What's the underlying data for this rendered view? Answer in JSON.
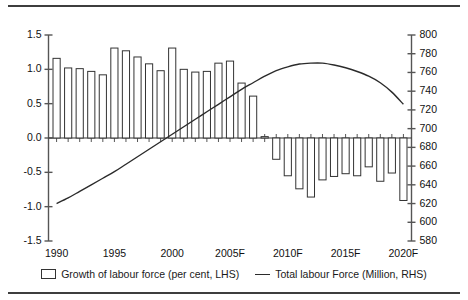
{
  "figure": {
    "has_top_rule": true,
    "has_bottom_rule": true,
    "background": "#ffffff",
    "line_color": "#2b2b2b",
    "bar_edge_color": "#333333",
    "bar_fill_color": "#ffffff",
    "axis_color": "#555555"
  },
  "legend": {
    "position": "bottom-center",
    "entries": [
      {
        "icon": "bar-swatch-icon",
        "label": "Growth of labour force (per cent, LHS)"
      },
      {
        "icon": "line-swatch-icon",
        "label": "Total labour Force (Million, RHS)"
      }
    ]
  },
  "axes": {
    "left": {
      "ticks": [
        "1.5",
        "1.0",
        "0.5",
        "0.0",
        "-0.5",
        "-1.0",
        "-1.5"
      ],
      "values": [
        1.5,
        1.0,
        0.5,
        0.0,
        -0.5,
        -1.0,
        -1.5
      ],
      "min": -1.5,
      "max": 1.5
    },
    "right": {
      "ticks": [
        "800",
        "780",
        "760",
        "740",
        "720",
        "700",
        "680",
        "660",
        "640",
        "620",
        "600",
        "580"
      ],
      "values": [
        800,
        780,
        760,
        740,
        720,
        700,
        680,
        660,
        640,
        620,
        600,
        580
      ],
      "min": 580,
      "max": 800
    },
    "bottom": {
      "ticks": [
        "1990",
        "1995",
        "2000",
        "2005F",
        "2010F",
        "2015F",
        "2020F"
      ],
      "tick_years": [
        1990,
        1995,
        2000,
        2005,
        2010,
        2015,
        2020
      ]
    }
  },
  "chart_data": {
    "type": "bar",
    "title": "",
    "subtitle": "",
    "xlabel": "",
    "ylabel": "",
    "y2label": "",
    "grid": false,
    "legend_position": "bottom",
    "categories": [
      "1990",
      "1991",
      "1992",
      "1993",
      "1994",
      "1995",
      "1996",
      "1997",
      "1998",
      "1999",
      "2000",
      "2001",
      "2002",
      "2003",
      "2004",
      "2005F",
      "2006F",
      "2007F",
      "2008F",
      "2009F",
      "2010F",
      "2011F",
      "2012F",
      "2013F",
      "2014F",
      "2015F",
      "2016F",
      "2017F",
      "2018F",
      "2019F",
      "2020F"
    ],
    "xlim": [
      1989.3,
      2020.7
    ],
    "ylim": [
      -1.5,
      1.5
    ],
    "y2lim": [
      580,
      800
    ],
    "series": [
      {
        "name": "Growth of labour force (per cent, LHS)",
        "type": "bar",
        "axis": "left",
        "unit": "per cent",
        "values": [
          1.16,
          1.02,
          1.01,
          0.97,
          0.92,
          1.31,
          1.27,
          1.18,
          1.08,
          0.98,
          1.31,
          1.0,
          0.96,
          0.97,
          1.09,
          1.12,
          0.8,
          0.61,
          0.02,
          -0.31,
          -0.55,
          -0.74,
          -0.86,
          -0.61,
          -0.56,
          -0.52,
          -0.55,
          -0.42,
          -0.63,
          -0.51,
          -0.91
        ]
      },
      {
        "name": "Total labour Force (Million, RHS)",
        "type": "line",
        "axis": "right",
        "unit": "Million",
        "values": [
          620,
          626,
          633,
          640,
          647,
          654,
          662,
          670,
          678,
          686,
          694,
          702,
          710,
          718,
          726,
          734,
          742,
          749,
          756,
          762,
          766,
          769,
          770,
          770,
          768,
          765,
          761,
          756,
          749,
          739,
          726
        ]
      }
    ]
  }
}
